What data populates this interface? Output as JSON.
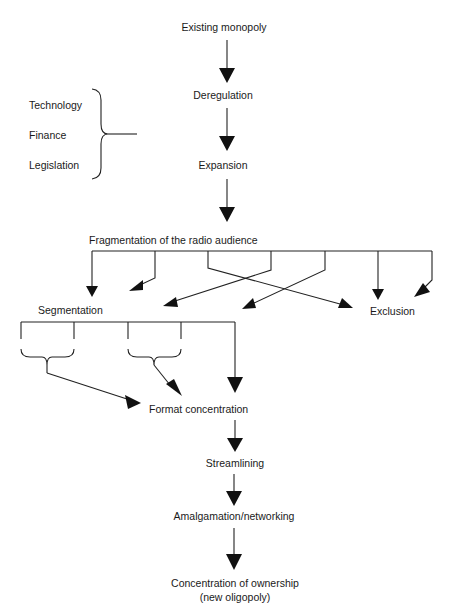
{
  "diagram": {
    "nodes": {
      "existing_monopoly": "Existing monopoly",
      "deregulation": "Deregulation",
      "expansion": "Expansion",
      "fragmentation": "Fragmentation of the radio audience",
      "segmentation": "Segmentation",
      "exclusion": "Exclusion",
      "format_concentration": "Format concentration",
      "streamlining": "Streamlining",
      "amalgamation": "Amalgamation/networking",
      "concentration_line1": "Concentration of ownership",
      "concentration_line2": "(new oligopoly)"
    },
    "drivers": [
      "Technology",
      "Finance",
      "Legislation"
    ],
    "edges": [
      [
        "existing_monopoly",
        "deregulation"
      ],
      [
        "drivers",
        "deregulation"
      ],
      [
        "deregulation",
        "expansion"
      ],
      [
        "expansion",
        "fragmentation"
      ],
      [
        "fragmentation",
        "segmentation"
      ],
      [
        "fragmentation",
        "exclusion"
      ],
      [
        "segmentation",
        "format_concentration"
      ],
      [
        "format_concentration",
        "streamlining"
      ],
      [
        "streamlining",
        "amalgamation"
      ],
      [
        "amalgamation",
        "concentration"
      ]
    ]
  }
}
